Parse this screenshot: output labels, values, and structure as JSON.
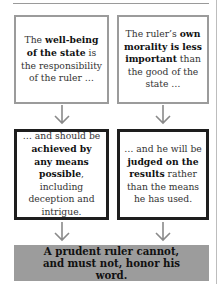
{
  "diagram": {
    "type": "flowchart",
    "colors": {
      "top_box_border": "#9b9b9b",
      "middle_box_border": "#1e1e1e",
      "final_box_fill": "#9c9c9c",
      "arrow": "#8a8a8a"
    },
    "top_left": {
      "pre": "The ",
      "bold": "well-being of the state",
      "post": " is the responsibility of the ruler …"
    },
    "top_right": {
      "pre": "The ruler’s ",
      "bold": "own morality is less important",
      "post": " than the good of the state …"
    },
    "middle_left": {
      "pre": "… and should be ",
      "bold": "achieved by any means possible",
      "post": ", including deception and intrigue."
    },
    "middle_right": {
      "pre": "… and he will be ",
      "bold": "judged on the results",
      "post": " rather than the means he has used."
    },
    "conclusion": "A prudent ruler cannot, and must not, honor his word."
  }
}
